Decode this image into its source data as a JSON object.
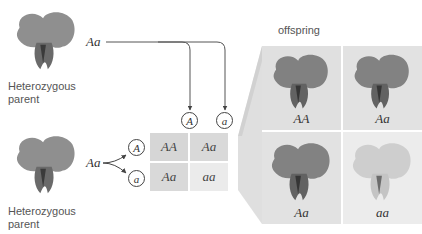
{
  "parents": [
    {
      "label_line1": "Heterozygous",
      "label_line2": "parent",
      "genotype": "Aa"
    },
    {
      "label_line1": "Heterozygous",
      "label_line2": "parent",
      "genotype": "Aa"
    }
  ],
  "gametes": {
    "top": [
      "A",
      "a"
    ],
    "side": [
      "A",
      "a"
    ]
  },
  "punnett": {
    "cells": [
      [
        "AA",
        "Aa"
      ],
      [
        "Aa",
        "aa"
      ]
    ]
  },
  "offspring": {
    "title": "offspring",
    "cells": [
      {
        "genotype": "AA",
        "phenotype": "purple"
      },
      {
        "genotype": "Aa",
        "phenotype": "purple"
      },
      {
        "genotype": "Aa",
        "phenotype": "purple"
      },
      {
        "genotype": "aa",
        "phenotype": "white"
      }
    ]
  },
  "colors": {
    "punnett_dark": "#d6d6d6",
    "punnett_light": "#e8e8e8",
    "offspring_bg": "#e2e2e2",
    "offspring_bg_light": "#ececec",
    "line": "#555555"
  }
}
